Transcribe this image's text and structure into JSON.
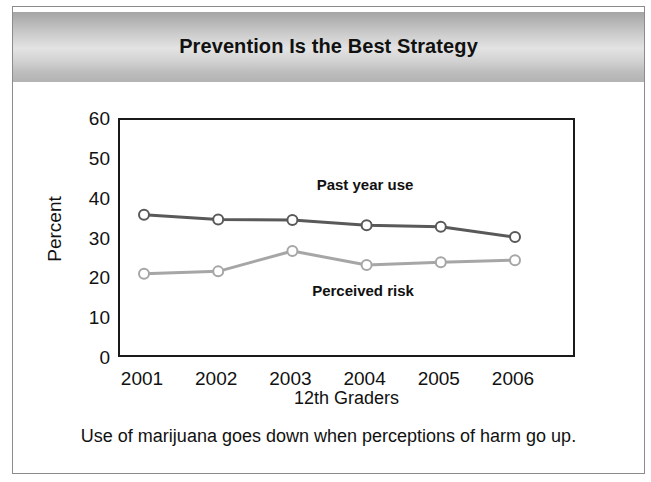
{
  "header": {
    "title": "Prevention Is the Best Strategy"
  },
  "caption": "Use of marijuana goes down when perceptions of harm go up.",
  "labels": {
    "series_past": "Past year use",
    "series_risk": "Perceived risk"
  },
  "colors": {
    "past_year_use": "#595959",
    "perceived_risk": "#a6a6a6",
    "axis": "#1a1a1a",
    "banner_light": "#e3e3e3",
    "banner_dark": "#a4a4a4",
    "text": "#111111"
  },
  "chart_data": {
    "type": "line",
    "title": "Prevention Is the Best Strategy",
    "subtitle": "",
    "xlabel": "12th Graders",
    "ylabel": "Percent",
    "categories": [
      "2001",
      "2002",
      "2003",
      "2004",
      "2005",
      "2006"
    ],
    "x": [
      2001,
      2002,
      2003,
      2004,
      2005,
      2006
    ],
    "ylim": [
      0,
      60
    ],
    "yticks": [
      0,
      10,
      20,
      30,
      40,
      50,
      60
    ],
    "ytick_labels": [
      "0",
      "10",
      "20",
      "30",
      "40",
      "50",
      "60"
    ],
    "xtick_labels": [
      "2001",
      "2002",
      "2003",
      "2004",
      "2005",
      "2006"
    ],
    "grid": false,
    "legend_position": "inline-annotations",
    "annotations": [
      {
        "text": "Past year use",
        "series": "Past year use",
        "position": "above-line"
      },
      {
        "text": "Perceived risk",
        "series": "Perceived risk",
        "position": "below-line"
      }
    ],
    "series": [
      {
        "name": "Past year use",
        "color": "#595959",
        "marker": "open-circle",
        "values": [
          36.2,
          35.0,
          34.9,
          33.6,
          33.2,
          30.6
        ]
      },
      {
        "name": "Perceived risk",
        "color": "#a6a6a6",
        "marker": "open-circle",
        "values": [
          21.4,
          22.0,
          27.1,
          23.6,
          24.3,
          24.8
        ]
      }
    ]
  }
}
